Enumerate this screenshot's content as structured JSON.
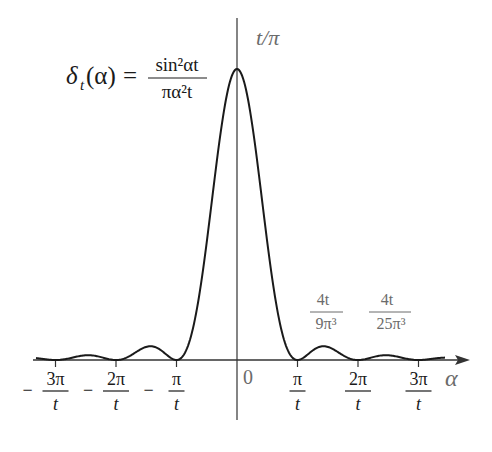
{
  "diagram": {
    "title_formula": {
      "lhs": "δ",
      "lhs_sub": "t",
      "lhs_arg": "(α)",
      "equals": "=",
      "numerator": "sin²αt",
      "denominator": "πα²t"
    },
    "peak_label": "t/π",
    "axis_label_x": "α",
    "origin_label": "0",
    "ticks": [
      {
        "sign": "−",
        "num": "3π",
        "den": "t",
        "value": -3
      },
      {
        "sign": "−",
        "num": "2π",
        "den": "t",
        "value": -2
      },
      {
        "sign": "−",
        "num": "π",
        "den": "t",
        "value": -1
      },
      {
        "sign": "",
        "num": "π",
        "den": "t",
        "value": 1
      },
      {
        "sign": "",
        "num": "2π",
        "den": "t",
        "value": 2
      },
      {
        "sign": "",
        "num": "3π",
        "den": "t",
        "value": 3
      }
    ],
    "sidelobe_labels": [
      {
        "num": "4t",
        "den": "9π³"
      },
      {
        "num": "4t",
        "den": "25π³"
      }
    ],
    "colors": {
      "curve": "#1a1a1a",
      "axis": "#333333",
      "annotation": "#6b6b6b"
    }
  },
  "chart_data": {
    "type": "line",
    "xlabel": "α",
    "ylabel": "",
    "x_ticks": [
      "−3π/t",
      "−2π/t",
      "−π/t",
      "0",
      "π/t",
      "2π/t",
      "3π/t"
    ],
    "x_range_units_pi_over_t": [
      -3.2,
      3.6
    ],
    "annotations": [
      "t/π (peak at α=0)",
      "4t/(9π³) (sidelobe near 3π/2t)",
      "4t/(25π³) (sidelobe near 5π/2t)"
    ],
    "series": [
      {
        "name": "δ_t(α) normalized (peak = t/π → 1)",
        "x_units_pi_over_t": [
          -3,
          -2.5,
          -2,
          -1.5,
          -1,
          -0.75,
          -0.5,
          -0.25,
          0,
          0.25,
          0.5,
          0.75,
          1,
          1.5,
          2,
          2.5,
          3
        ],
        "values": [
          0,
          0.016,
          0,
          0.045,
          0,
          0.18,
          0.405,
          0.811,
          1,
          0.811,
          0.405,
          0.18,
          0,
          0.045,
          0,
          0.016,
          0
        ]
      }
    ],
    "grid": false,
    "legend": "none"
  }
}
